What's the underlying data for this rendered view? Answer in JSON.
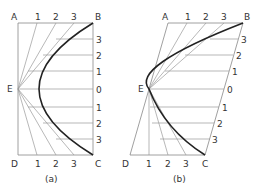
{
  "figure": {
    "panels": [
      {
        "id": "a",
        "caption": "(a)",
        "corners": {
          "A": "A",
          "B": "B",
          "C": "C",
          "D": "D",
          "E": "E"
        },
        "top_divisions": [
          "1",
          "2",
          "3"
        ],
        "right_divisions_upper": [
          "3",
          "2",
          "1",
          "0"
        ],
        "right_divisions_lower": [
          "1",
          "2",
          "3"
        ],
        "bottom_divisions": [
          "1",
          "2",
          "3"
        ]
      },
      {
        "id": "b",
        "caption": "(b)",
        "corners": {
          "A": "A",
          "B": "B",
          "C": "C",
          "D": "D",
          "E": "E"
        },
        "top_divisions": [
          "1",
          "2",
          "3"
        ],
        "right_divisions_upper": [
          "3",
          "2",
          "1",
          "0"
        ],
        "right_divisions_lower": [
          "1",
          "2",
          "3"
        ],
        "bottom_divisions": [
          "1",
          "2",
          "3"
        ]
      }
    ],
    "colors": {
      "thin_line": "#888888",
      "curve": "#222222",
      "text": "#333333"
    }
  }
}
